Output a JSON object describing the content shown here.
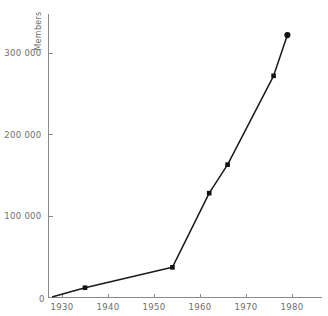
{
  "figure": {
    "title_fragment": "",
    "background": "#ffffff",
    "line_color": "#1a1a1a",
    "axis_color": "#8a8a8a",
    "label_color": "#6d6d6d"
  },
  "chart_data": {
    "type": "line",
    "title": "",
    "xlabel": "",
    "ylabel": "Members",
    "xlim": [
      1927,
      1982
    ],
    "ylim": [
      0,
      340000
    ],
    "grid": false,
    "legend": null,
    "x_ticks": [
      1930,
      1940,
      1950,
      1960,
      1970,
      1980
    ],
    "x_tick_labels": [
      "1930",
      "1940",
      "1950",
      "1960",
      "1970",
      "1980"
    ],
    "y_ticks": [
      100000,
      200000,
      300000
    ],
    "y_tick_labels": [
      "100 000",
      "200 000",
      "300 000"
    ],
    "origin_label": "0",
    "marker_style": "filled-square",
    "series": [
      {
        "name": "Members",
        "x": [
          1928,
          1935,
          1954,
          1962,
          1966,
          1976,
          1979
        ],
        "values": [
          1000,
          12000,
          37000,
          128000,
          163000,
          272000,
          322000
        ]
      }
    ]
  }
}
